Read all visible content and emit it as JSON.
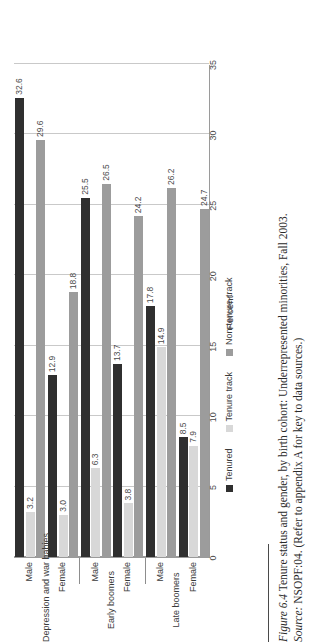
{
  "figure": {
    "number_label": "Figure 6.4",
    "caption_main": "Tenure status and gender, by birth cohort: Underrepresented minorities, Fall 2003.",
    "source_label": "Source:",
    "source_text": "NSOPF:04. (Refer to appendix A for key to data sources.)"
  },
  "legend": {
    "items": [
      {
        "label": "Tenured",
        "color": "#2f2f2f"
      },
      {
        "label": "Tenure track",
        "color": "#d8d8d8"
      },
      {
        "label": "Non-tenure-track",
        "color": "#9c9c9c"
      }
    ]
  },
  "axis": {
    "y_title": "Percent",
    "ticks": [
      "0",
      "5",
      "10",
      "15",
      "20",
      "25",
      "30",
      "35"
    ]
  },
  "cohorts": [
    {
      "name": "Depression and war babies"
    },
    {
      "name": "Early boomers"
    },
    {
      "name": "Late boomers"
    }
  ],
  "genders": [
    "Male",
    "Female"
  ],
  "chart_data": {
    "type": "bar",
    "title": "Tenure status and gender, by birth cohort: Underrepresented minorities, Fall 2003",
    "xlabel": "",
    "ylabel": "Percent",
    "ylim": [
      0,
      35
    ],
    "ytick_step": 5,
    "grid": true,
    "orientation": "vertical-grouped",
    "legend_position": "bottom",
    "categories": [
      "Depression and war babies - Male",
      "Depression and war babies - Female",
      "Early boomers - Male",
      "Early boomers - Female",
      "Late boomers - Male",
      "Late boomers - Female"
    ],
    "series": [
      {
        "name": "Tenured",
        "color": "#2f2f2f",
        "values": [
          32.6,
          12.9,
          25.5,
          13.7,
          17.8,
          8.5
        ]
      },
      {
        "name": "Tenure track",
        "color": "#d8d8d8",
        "values": [
          3.2,
          3.0,
          6.3,
          3.8,
          14.9,
          7.9
        ]
      },
      {
        "name": "Non-tenure-track",
        "color": "#9c9c9c",
        "values": [
          29.6,
          18.8,
          26.5,
          24.2,
          26.2,
          24.7
        ]
      }
    ],
    "data_labels": [
      "32.6",
      "3.2",
      "29.6",
      "12.9",
      "3.0",
      "18.8",
      "25.5",
      "6.3",
      "26.5",
      "13.7",
      "3.8",
      "24.2",
      "17.8",
      "14.9",
      "26.2",
      "8.5",
      "7.9",
      "24.7"
    ]
  }
}
